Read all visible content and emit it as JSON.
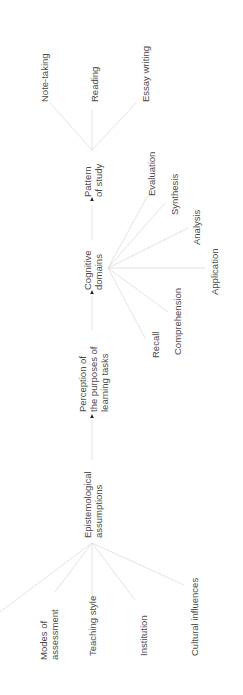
{
  "diagram": {
    "flow": [
      {
        "id": "epist",
        "label": [
          "Epistemological",
          "assumptions"
        ]
      },
      {
        "id": "percep",
        "label": [
          "Perception of",
          "the purposes of",
          "learning tasks"
        ]
      },
      {
        "id": "cog",
        "label": [
          "Cognitive",
          "domains"
        ]
      },
      {
        "id": "pattern",
        "label": [
          "Pattern",
          "of study"
        ]
      }
    ],
    "influences": {
      "target": "epist",
      "items": [
        {
          "label": [
            "Modes of",
            "assessment"
          ]
        },
        {
          "label": [
            "Teaching style"
          ]
        },
        {
          "label": [
            "Institution"
          ]
        },
        {
          "label": [
            "Cultural influences"
          ]
        }
      ]
    },
    "cognitive_domains": {
      "source": "cog",
      "items": [
        {
          "label": [
            "Recall"
          ]
        },
        {
          "label": [
            "Comprehension"
          ]
        },
        {
          "label": [
            "Application"
          ]
        },
        {
          "label": [
            "Analysis"
          ]
        },
        {
          "label": [
            "Synthesis"
          ]
        },
        {
          "label": [
            "Evaluation"
          ]
        }
      ]
    },
    "study_patterns": {
      "source": "pattern",
      "items": [
        {
          "label": [
            "Note-taking"
          ]
        },
        {
          "label": [
            "Reading"
          ]
        },
        {
          "label": [
            "Essay writing"
          ]
        }
      ]
    },
    "colors": {
      "text": "#4a4a4a",
      "line": "#dcdcdc",
      "arrow": "#222222"
    }
  }
}
